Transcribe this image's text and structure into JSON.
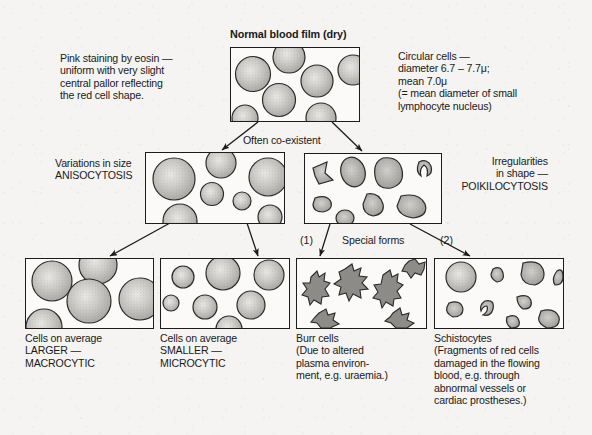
{
  "figure": {
    "title": "Normal blood film (dry)",
    "background_color": "#f5f4f2",
    "ink_color": "#1c1c1c",
    "cell_fill_color": "#b4b4b4"
  },
  "annotations": {
    "left_top": "Pink staining by eosin —\nuniform with very slight\ncentral pallor reflecting\nthe red cell shape.",
    "right_top": "Circular cells —\ndiameter 6.7 – 7.7μ;\nmean 7.0μ\n(= mean diameter of small\nlymphocyte nucleus)",
    "co_existent": "Often co-existent",
    "special_forms": "Special forms",
    "marker_one": "(1)",
    "marker_two": "(2)",
    "anisocytosis": "Variations in size\nANISOCYTOSIS",
    "poikilocytosis": "Irregularities\nin shape —\nPOIKILOCYTOSIS"
  },
  "panels": [
    {
      "id": "normal-blood-film",
      "name": "normal-blood-film-panel",
      "caption": ""
    },
    {
      "id": "anisocytosis",
      "name": "anisocytosis-panel",
      "caption": ""
    },
    {
      "id": "poikilocytosis",
      "name": "poikilocytosis-panel",
      "caption": ""
    },
    {
      "id": "macrocytic",
      "name": "macrocytic-panel",
      "caption": "Cells on average\nLARGER —\nMACROCYTIC"
    },
    {
      "id": "microcytic",
      "name": "microcytic-panel",
      "caption": "Cells on average\nSMALLER —\nMICROCYTIC"
    },
    {
      "id": "burr-cells",
      "name": "burr-cells-panel",
      "caption": "Burr cells\n(Due to altered\nplasma environ-\nment, e.g. uraemia.)"
    },
    {
      "id": "schistocytes",
      "name": "schistocytes-panel",
      "caption": "Schistocytes\n(Fragments of red cells\ndamaged in the flowing\nblood, e.g. through\nabnormal vessels or\ncardiac prostheses.)"
    }
  ]
}
